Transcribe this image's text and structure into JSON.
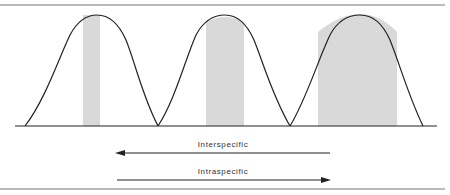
{
  "diagram": {
    "curves": [
      {
        "name": "species-1",
        "start_x": 25,
        "peak_x": 97,
        "end_x": 158,
        "shade_x1": 83,
        "shade_x2": 100
      },
      {
        "name": "species-2",
        "start_x": 158,
        "peak_x": 225,
        "end_x": 290,
        "shade_x1": 206,
        "shade_x2": 244
      },
      {
        "name": "species-3",
        "start_x": 290,
        "peak_x": 360,
        "end_x": 423,
        "shade_x1": 318,
        "shade_x2": 397
      }
    ],
    "arrows": {
      "interspecific": {
        "label": "Interspecific",
        "direction": "left"
      },
      "intraspecific": {
        "label": "Intraspecific",
        "direction": "right"
      }
    },
    "colors": {
      "line": "#222222",
      "shade": "#d9d9d9",
      "rule": "#777777"
    }
  }
}
